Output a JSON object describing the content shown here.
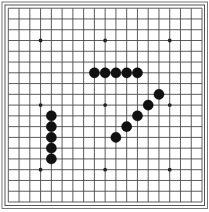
{
  "game": {
    "type": "gomoku",
    "board_size": 19,
    "star_points": [
      [
        3,
        3
      ],
      [
        3,
        9
      ],
      [
        3,
        15
      ],
      [
        9,
        3
      ],
      [
        9,
        9
      ],
      [
        9,
        15
      ],
      [
        15,
        3
      ],
      [
        15,
        9
      ],
      [
        15,
        15
      ]
    ],
    "stones": [
      {
        "row": 6,
        "col": 8,
        "color": "black"
      },
      {
        "row": 6,
        "col": 9,
        "color": "black"
      },
      {
        "row": 6,
        "col": 10,
        "color": "black"
      },
      {
        "row": 6,
        "col": 11,
        "color": "black"
      },
      {
        "row": 6,
        "col": 12,
        "color": "black"
      },
      {
        "row": 8,
        "col": 14,
        "color": "black"
      },
      {
        "row": 9,
        "col": 13,
        "color": "black"
      },
      {
        "row": 10,
        "col": 12,
        "color": "black"
      },
      {
        "row": 11,
        "col": 11,
        "color": "black"
      },
      {
        "row": 12,
        "col": 10,
        "color": "black"
      },
      {
        "row": 10,
        "col": 4,
        "color": "black"
      },
      {
        "row": 11,
        "col": 4,
        "color": "black"
      },
      {
        "row": 12,
        "col": 4,
        "color": "black"
      },
      {
        "row": 13,
        "col": 4,
        "color": "black"
      },
      {
        "row": 14,
        "col": 4,
        "color": "black"
      }
    ]
  },
  "colors": {
    "background": "#ffffff",
    "grid_line": "#4a4a4a",
    "border": "#555555",
    "stone_black": "#111111"
  }
}
